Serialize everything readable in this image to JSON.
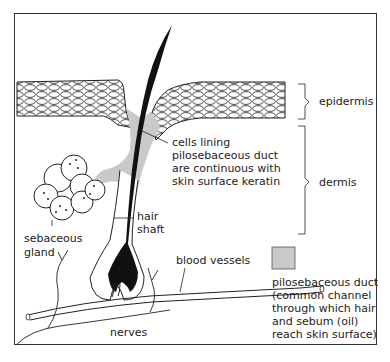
{
  "diagram": {
    "type": "skin cross-section with hair follicle",
    "colors": {
      "duct": "#c9c9c9",
      "hair": "#111111",
      "line": "#222222"
    },
    "labels": {
      "epidermis": "epidermis",
      "dermis": "dermis",
      "cells_lining": [
        "cells lining",
        "pilosebaceous duct",
        "are continuous with",
        "skin surface keratin"
      ],
      "hair_shaft": [
        "hair",
        "shaft"
      ],
      "sebaceous_gland": [
        "sebaceous",
        "gland"
      ],
      "blood_vessels": "blood vessels",
      "nerves": "nerves"
    },
    "legend": {
      "swatch_color": "#c9c9c9",
      "text": [
        "pilosebaceous duct",
        "(common channel",
        "through which hair",
        "and sebum (oil)",
        "reach skin surface)"
      ]
    }
  }
}
